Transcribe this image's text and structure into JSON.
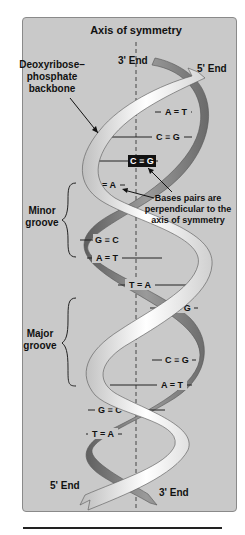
{
  "diagram": {
    "title": "Axis of symmetry",
    "labels": {
      "backbone": [
        "Deoxyribose–",
        "phosphate",
        "backbone"
      ],
      "top_left_end": "3' End",
      "top_right_end": "5' End",
      "bottom_left_end": "5' End",
      "bottom_right_end": "3' End",
      "minor_groove": [
        "Minor",
        "groove"
      ],
      "major_groove": [
        "Major",
        "groove"
      ],
      "perpendicular_note": [
        "Bases pairs are",
        "perpendicular to the",
        "axis of symmetry"
      ]
    },
    "base_pairs": [
      {
        "label": "A = T",
        "highlighted": false
      },
      {
        "label": "C ≡ G",
        "highlighted": false
      },
      {
        "label": "C ≡ G",
        "highlighted": true
      },
      {
        "label": "T = A",
        "highlighted": false
      },
      {
        "label": "G ≡ C",
        "highlighted": false
      },
      {
        "label": "A = T",
        "highlighted": false
      },
      {
        "label": "T = A",
        "highlighted": false
      },
      {
        "label": "C ≡ G",
        "highlighted": false
      },
      {
        "label": "C ≡ G",
        "highlighted": false
      },
      {
        "label": "A = T",
        "highlighted": false
      },
      {
        "label": "G ≡ C",
        "highlighted": false
      },
      {
        "label": "T = A",
        "highlighted": false
      }
    ],
    "colors": {
      "panel": "#c9c9c9",
      "light_strand": "#f2f2f2",
      "dark_strand": "#7d7d7d",
      "text": "#111111"
    }
  }
}
